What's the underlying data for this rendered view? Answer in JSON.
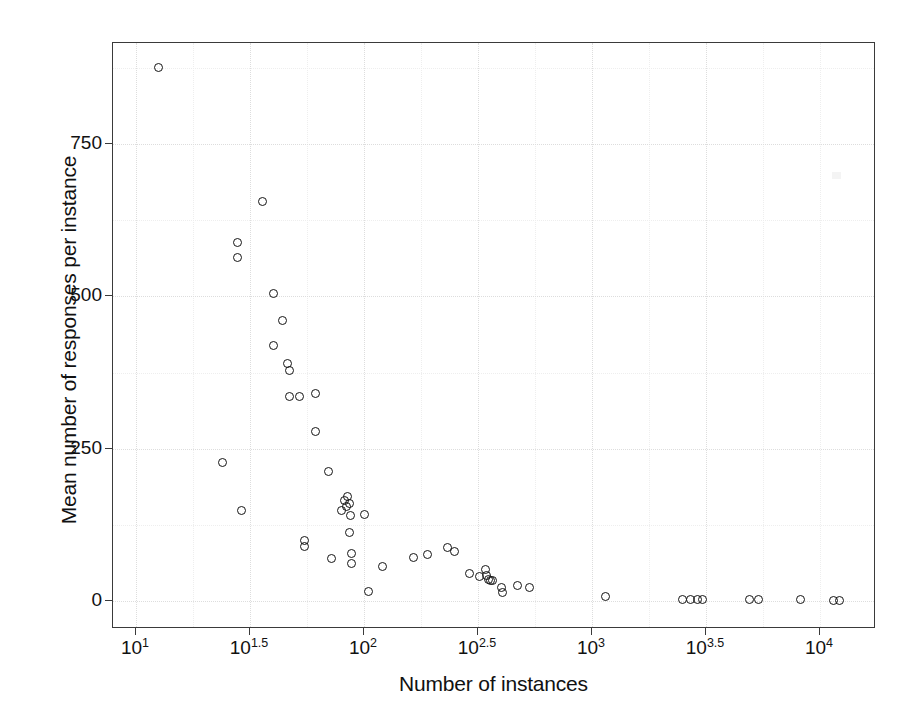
{
  "chart_data": {
    "type": "scatter",
    "title": "",
    "xlabel": "Number of instances",
    "ylabel": "Mean number of responses per instance",
    "xscale": "log10",
    "yscale": "linear",
    "xlim_log10": [
      0.9,
      4.15
    ],
    "ylim": [
      -40,
      925
    ],
    "grid": true,
    "legend": null,
    "marker": "open-circle",
    "xticks_log10": [
      1,
      1.5,
      2,
      2.5,
      3,
      3.5,
      4
    ],
    "xtick_labels": [
      "10",
      "10",
      "10",
      "10",
      "10",
      "10",
      "10"
    ],
    "xtick_exponents": [
      "1",
      "1.5",
      "2",
      "2.5",
      "3",
      "3.5",
      "4"
    ],
    "yticks": [
      0,
      250,
      500,
      750
    ],
    "ytick_labels": [
      "0",
      "250",
      "500",
      "750"
    ],
    "points": [
      {
        "x": 12.5,
        "y": 875
      },
      {
        "x": 24,
        "y": 228
      },
      {
        "x": 28,
        "y": 588
      },
      {
        "x": 28,
        "y": 563
      },
      {
        "x": 36,
        "y": 655
      },
      {
        "x": 40,
        "y": 505
      },
      {
        "x": 44,
        "y": 460
      },
      {
        "x": 40,
        "y": 420
      },
      {
        "x": 29,
        "y": 148
      },
      {
        "x": 46,
        "y": 390
      },
      {
        "x": 47,
        "y": 378
      },
      {
        "x": 47,
        "y": 335
      },
      {
        "x": 52,
        "y": 335
      },
      {
        "x": 55,
        "y": 100
      },
      {
        "x": 55,
        "y": 90
      },
      {
        "x": 61,
        "y": 340
      },
      {
        "x": 61,
        "y": 278
      },
      {
        "x": 70,
        "y": 213
      },
      {
        "x": 72,
        "y": 70
      },
      {
        "x": 80,
        "y": 148
      },
      {
        "x": 82,
        "y": 165
      },
      {
        "x": 85,
        "y": 172
      },
      {
        "x": 86,
        "y": 160
      },
      {
        "x": 84,
        "y": 155
      },
      {
        "x": 87,
        "y": 140
      },
      {
        "x": 86,
        "y": 112
      },
      {
        "x": 88,
        "y": 78
      },
      {
        "x": 88,
        "y": 62
      },
      {
        "x": 100,
        "y": 142
      },
      {
        "x": 105,
        "y": 15
      },
      {
        "x": 120,
        "y": 57
      },
      {
        "x": 165,
        "y": 72
      },
      {
        "x": 190,
        "y": 76
      },
      {
        "x": 232,
        "y": 88
      },
      {
        "x": 250,
        "y": 82
      },
      {
        "x": 290,
        "y": 45
      },
      {
        "x": 320,
        "y": 40
      },
      {
        "x": 340,
        "y": 52
      },
      {
        "x": 345,
        "y": 42
      },
      {
        "x": 350,
        "y": 36
      },
      {
        "x": 358,
        "y": 34
      },
      {
        "x": 365,
        "y": 33
      },
      {
        "x": 400,
        "y": 22
      },
      {
        "x": 405,
        "y": 14
      },
      {
        "x": 470,
        "y": 25
      },
      {
        "x": 530,
        "y": 22
      },
      {
        "x": 1150,
        "y": 8
      },
      {
        "x": 2500,
        "y": 3
      },
      {
        "x": 2700,
        "y": 3
      },
      {
        "x": 2900,
        "y": 2
      },
      {
        "x": 3050,
        "y": 2
      },
      {
        "x": 4900,
        "y": 2
      },
      {
        "x": 5400,
        "y": 2
      },
      {
        "x": 8200,
        "y": 2
      },
      {
        "x": 11500,
        "y": 1
      },
      {
        "x": 12200,
        "y": 1
      }
    ]
  },
  "axes": {
    "x_title": "Number of instances",
    "y_title": "Mean number of responses per instance",
    "x_tick_base": "10",
    "y_ticks": [
      "750",
      "500",
      "250",
      "0"
    ],
    "x_ticks": [
      {
        "base": "10",
        "exp": "1"
      },
      {
        "base": "10",
        "exp": "1.5"
      },
      {
        "base": "10",
        "exp": "2"
      },
      {
        "base": "10",
        "exp": "2.5"
      },
      {
        "base": "10",
        "exp": "3"
      },
      {
        "base": "10",
        "exp": "3.5"
      },
      {
        "base": "10",
        "exp": "4"
      }
    ]
  },
  "style": {
    "point_color": "#151515",
    "axis_color": "#3a3a3a",
    "grid_color": "#dddddd",
    "background": "#ffffff",
    "text_color": "#111111"
  }
}
